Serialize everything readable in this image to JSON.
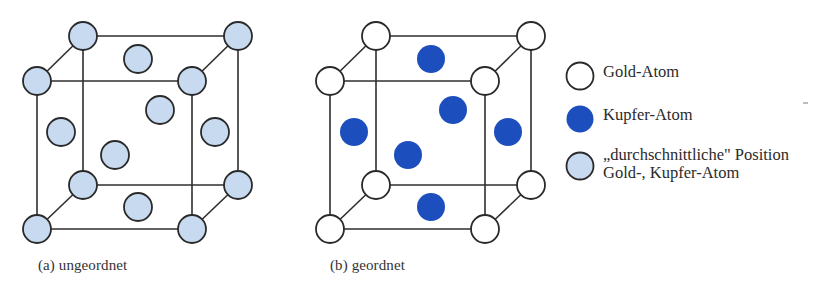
{
  "colors": {
    "line": "#2e2e2e",
    "gold_fill": "#ffffff",
    "copper_fill": "#1c4fbd",
    "average_fill": "#c7daf0",
    "atom_stroke": "#2a2a2a"
  },
  "panels": [
    {
      "id": "a",
      "caption": "(a) ungeordnet",
      "corner_atom_type": "average",
      "face_atom_type": "average"
    },
    {
      "id": "b",
      "caption": "(b) geordnet",
      "corner_atom_type": "gold",
      "face_atom_type": "copper"
    }
  ],
  "legend": [
    {
      "type": "gold",
      "label_lines": [
        "Gold-Atom"
      ]
    },
    {
      "type": "copper",
      "label_lines": [
        "Kupfer-Atom"
      ]
    },
    {
      "type": "average",
      "label_lines": [
        "„durchschnittliche\" Position",
        "Gold-, Kupfer-Atom"
      ]
    }
  ],
  "chart_data": {
    "type": "diagram",
    "title": "",
    "structure": "fcc",
    "panels": [
      {
        "label": "(a) ungeordnet",
        "corners": {
          "count": 8,
          "atom": "durchschnittliche Position Gold-, Kupfer-Atom"
        },
        "face_centers": {
          "count": 6,
          "atom": "durchschnittliche Position Gold-, Kupfer-Atom"
        }
      },
      {
        "label": "(b) geordnet",
        "corners": {
          "count": 8,
          "atom": "Gold-Atom"
        },
        "face_centers": {
          "count": 6,
          "atom": "Kupfer-Atom"
        }
      }
    ],
    "legend": [
      "Gold-Atom",
      "Kupfer-Atom",
      "„durchschnittliche\" Position Gold-, Kupfer-Atom"
    ]
  }
}
